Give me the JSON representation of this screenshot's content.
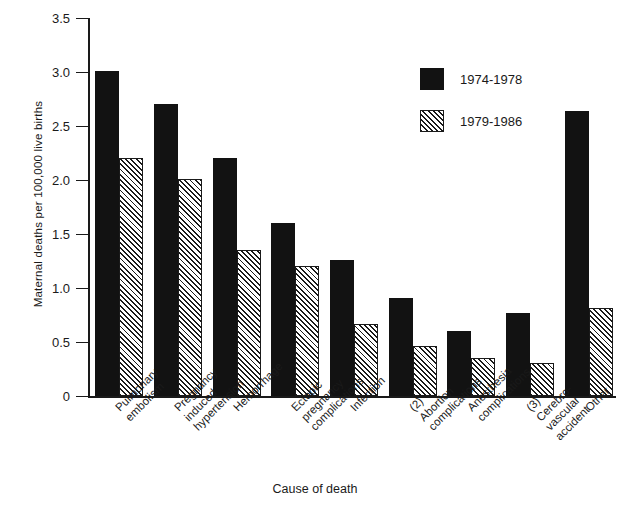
{
  "chart_data": {
    "type": "bar",
    "title": "",
    "xlabel": "Cause of death",
    "ylabel": "Maternal deaths per 100,000 live births",
    "ylim": [
      0,
      3.5
    ],
    "ytick_labels": [
      "0",
      "0.5",
      "1.0",
      "1.5",
      "2.0",
      "2.5",
      "3.0",
      "3.5"
    ],
    "ytick_values": [
      0,
      0.5,
      1.0,
      1.5,
      2.0,
      2.5,
      3.0,
      3.5
    ],
    "grid": false,
    "legend_position": "top-right",
    "categories": [
      "Pulmonary\nembolism",
      "Pregnancy\ninduced\nhypertension",
      "Hemorrhage",
      "Ectopic\npregnancy\ncomplications",
      "Infection",
      "(2)\nAbortion\ncomplications",
      "Anesthesia\ncomplications",
      "(3)\nCerebro-\nvascular\naccident",
      "Other"
    ],
    "series": [
      {
        "name": "1974-1978",
        "style": "solid",
        "color": "#121212",
        "values": [
          3.01,
          2.71,
          2.21,
          1.61,
          1.26,
          0.91,
          0.61,
          0.77,
          2.64
        ]
      },
      {
        "name": "1979-1986",
        "style": "hatched",
        "color": "#1a1a1a",
        "values": [
          2.21,
          2.01,
          1.36,
          1.21,
          0.67,
          0.47,
          0.36,
          0.31,
          0.82
        ]
      }
    ]
  }
}
